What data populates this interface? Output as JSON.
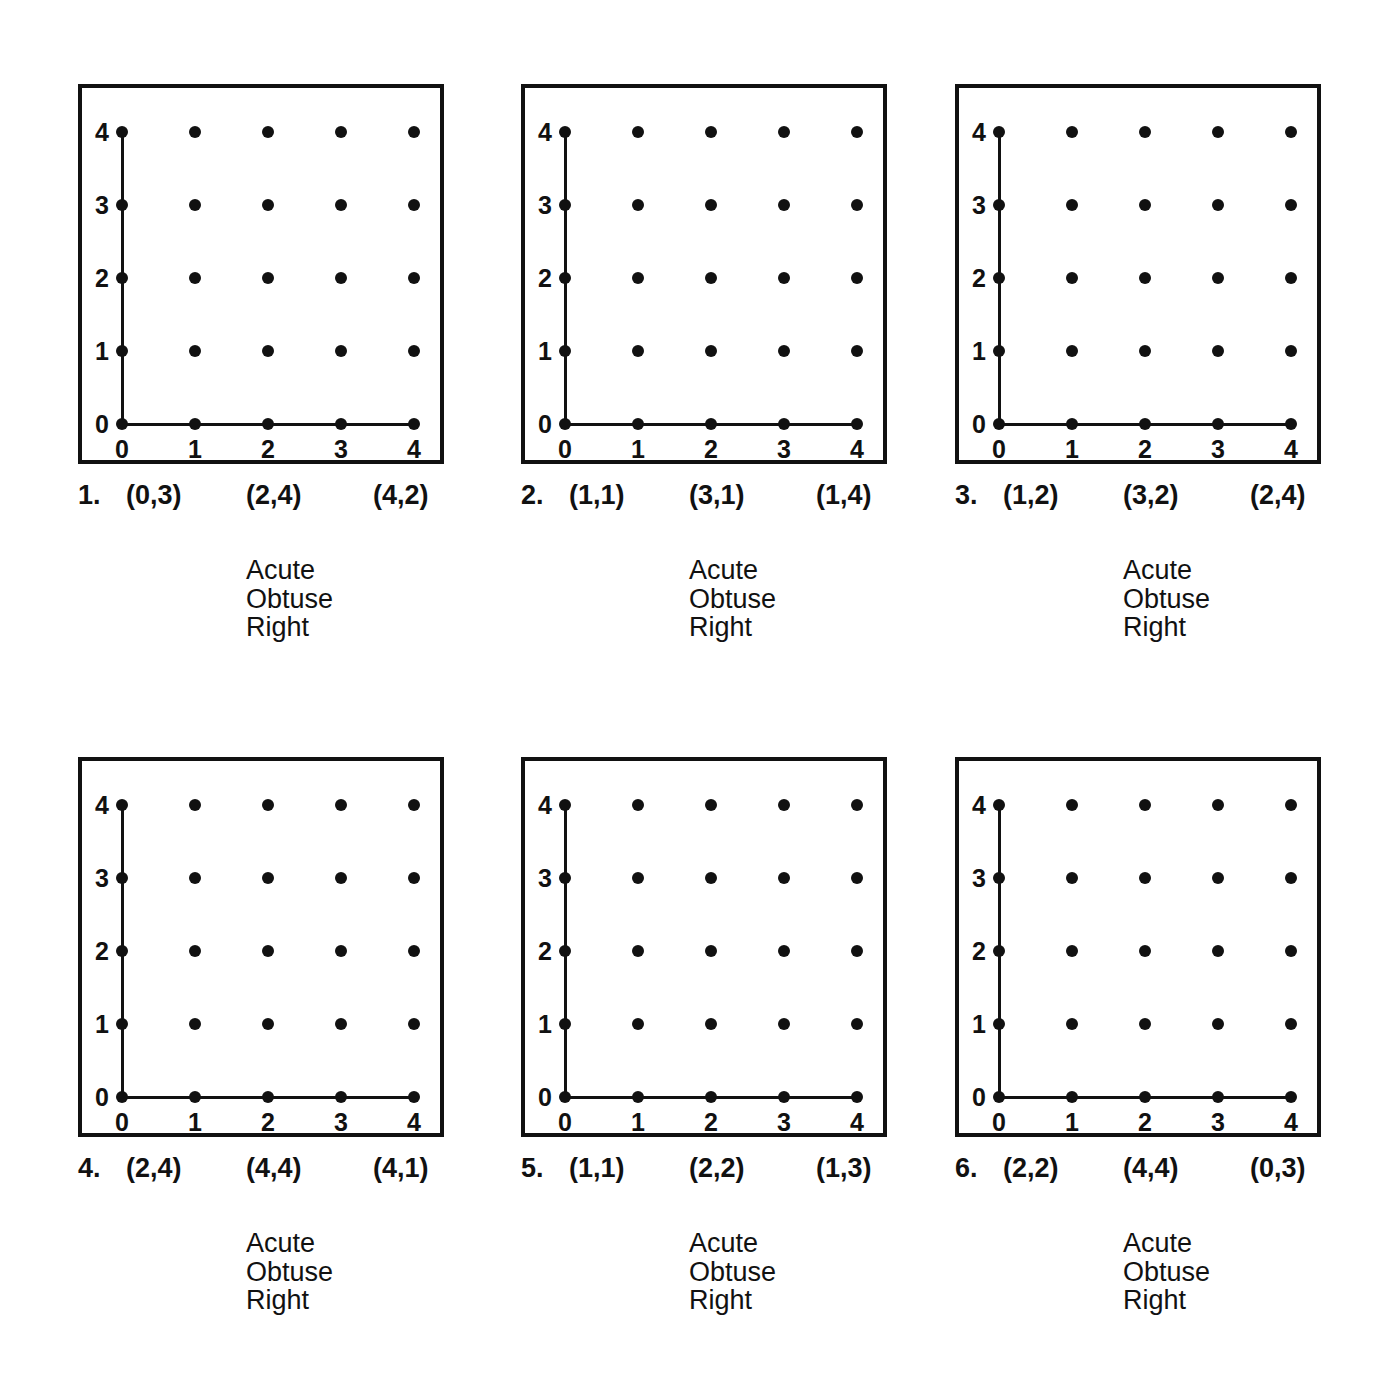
{
  "axis": {
    "x_ticks": [
      "0",
      "1",
      "2",
      "3",
      "4"
    ],
    "y_ticks": [
      "0",
      "1",
      "2",
      "3",
      "4"
    ],
    "x_min": 0,
    "x_max": 4,
    "y_min": 0,
    "y_max": 4
  },
  "choices": [
    "Acute",
    "Obtuse",
    "Right"
  ],
  "problems": [
    {
      "number": "1.",
      "points": [
        "(0,3)",
        "(2,4)",
        "(4,2)"
      ],
      "choices": [
        "Acute",
        "Obtuse",
        "Right"
      ]
    },
    {
      "number": "2.",
      "points": [
        "(1,1)",
        "(3,1)",
        "(1,4)"
      ],
      "choices": [
        "Acute",
        "Obtuse",
        "Right"
      ]
    },
    {
      "number": "3.",
      "points": [
        "(1,2)",
        "(3,2)",
        "(2,4)"
      ],
      "choices": [
        "Acute",
        "Obtuse",
        "Right"
      ]
    },
    {
      "number": "4.",
      "points": [
        "(2,4)",
        "(4,4)",
        "(4,1)"
      ],
      "choices": [
        "Acute",
        "Obtuse",
        "Right"
      ]
    },
    {
      "number": "5.",
      "points": [
        "(1,1)",
        "(2,2)",
        "(1,3)"
      ],
      "choices": [
        "Acute",
        "Obtuse",
        "Right"
      ]
    },
    {
      "number": "6.",
      "points": [
        "(2,2)",
        "(4,4)",
        "(0,3)"
      ],
      "choices": [
        "Acute",
        "Obtuse",
        "Right"
      ]
    }
  ],
  "chart_data": {
    "type": "scatter",
    "xlabel": "",
    "ylabel": "",
    "xlim": [
      0,
      4
    ],
    "ylim": [
      0,
      4
    ],
    "grid": false,
    "legend": "none",
    "lattice_points": [
      [
        0,
        0
      ],
      [
        1,
        0
      ],
      [
        2,
        0
      ],
      [
        3,
        0
      ],
      [
        4,
        0
      ],
      [
        0,
        1
      ],
      [
        1,
        1
      ],
      [
        2,
        1
      ],
      [
        3,
        1
      ],
      [
        4,
        1
      ],
      [
        0,
        2
      ],
      [
        1,
        2
      ],
      [
        2,
        2
      ],
      [
        3,
        2
      ],
      [
        4,
        2
      ],
      [
        0,
        3
      ],
      [
        1,
        3
      ],
      [
        2,
        3
      ],
      [
        3,
        3
      ],
      [
        4,
        3
      ],
      [
        0,
        4
      ],
      [
        1,
        4
      ],
      [
        2,
        4
      ],
      [
        3,
        4
      ],
      [
        4,
        4
      ]
    ],
    "axes_drawn": [
      "x-axis from (0,0) to (4,0)",
      "y-axis from (0,0) to (0,4)"
    ],
    "repeated_panels": 6
  },
  "colors": {
    "ink": "#111111",
    "paper": "#ffffff"
  }
}
